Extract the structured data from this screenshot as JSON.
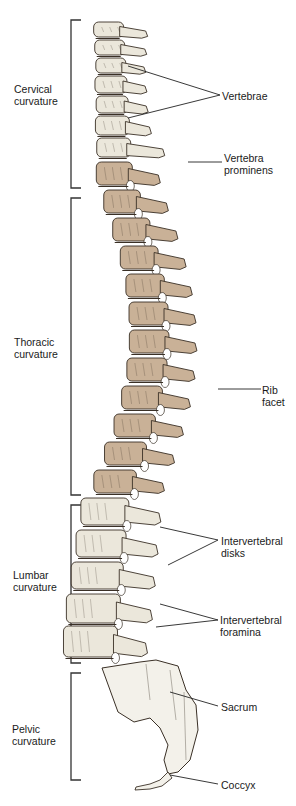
{
  "figure": {
    "regions": [
      {
        "id": "cervical",
        "line1": "Cervical",
        "line2": "curvature",
        "color": "#ebe7db"
      },
      {
        "id": "thoracic",
        "line1": "Thoracic",
        "line2": "curvature",
        "color": "#c9b197"
      },
      {
        "id": "lumbar",
        "line1": "Lumbar",
        "line2": "curvature",
        "color": "#ebe7db"
      },
      {
        "id": "pelvic",
        "line1": "Pelvic",
        "line2": "curvature",
        "color": "#f3f1ea"
      }
    ],
    "callouts": [
      {
        "id": "vertebrae",
        "line1": "Vertebrae",
        "line2": ""
      },
      {
        "id": "vertebra-prominens",
        "line1": "Vertebra",
        "line2": "prominens"
      },
      {
        "id": "rib-facet",
        "line1": "Rib",
        "line2": "facet"
      },
      {
        "id": "intervertebral-disks",
        "line1": "Intervertebral",
        "line2": "disks"
      },
      {
        "id": "intervertebral-foramina",
        "line1": "Intervertebral",
        "line2": "foramina"
      },
      {
        "id": "sacrum",
        "line1": "Sacrum",
        "line2": ""
      },
      {
        "id": "coccyx",
        "line1": "Coccyx",
        "line2": ""
      }
    ],
    "colors": {
      "outline": "#3a3026",
      "bone_light": "#ebe7db",
      "bone_thoracic": "#c9b197",
      "bone_pelvic": "#f3f1ea",
      "leader": "#222222"
    }
  }
}
